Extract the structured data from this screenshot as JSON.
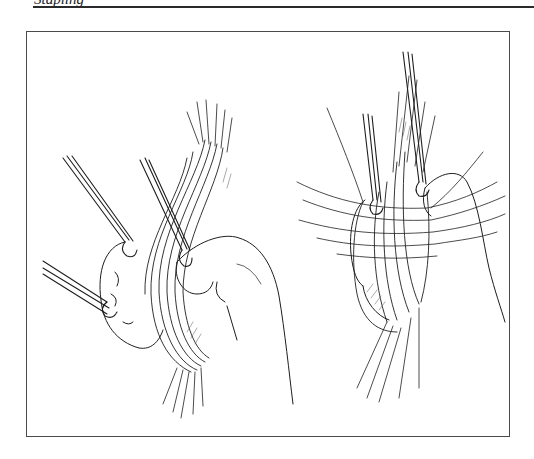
{
  "page": {
    "running_head": "Stapling",
    "running_head_visible": "partial (cut off at top edge)"
  },
  "figure": {
    "panels": [
      {
        "id": "left",
        "description": "Surgical illustration: bundle of tissue/vessels retracted with three forceps-style retractors, hand grasping from right"
      },
      {
        "id": "right",
        "description": "Surgical illustration: tissue bundle with multiple sutures placed transversely, two retractors from above"
      }
    ],
    "colors": {
      "ink": "#1e1e1e",
      "frame": "#4a4a4a",
      "rule": "#2a2a2a",
      "paper": "#ffffff"
    }
  }
}
